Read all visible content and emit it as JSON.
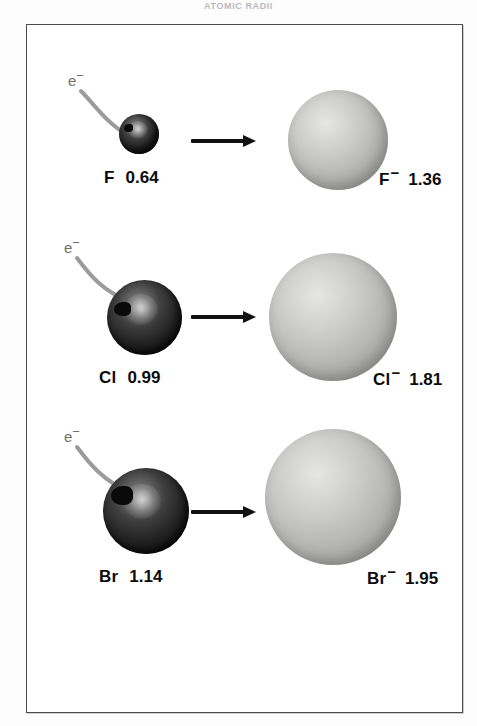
{
  "figure": {
    "top_caption": "ATOMIC RADII",
    "frame_color": "#4a4a50",
    "background_color": "#ffffff",
    "atom_color": "#1b1b1b",
    "ion_color": "#bdbdbb",
    "arrow_color": "#111111",
    "electron_curve_color": "#9b9b9b"
  },
  "rows": [
    {
      "id": "fluorine",
      "electron_label": "e",
      "electron_charge": "−",
      "atom": {
        "symbol": "F",
        "radius": "0.64",
        "radius_px": 20
      },
      "ion": {
        "symbol": "F",
        "charge": "−",
        "radius": "1.36",
        "radius_px": 50
      }
    },
    {
      "id": "chlorine",
      "electron_label": "e",
      "electron_charge": "−",
      "atom": {
        "symbol": "Cl",
        "radius": "0.99",
        "radius_px": 37
      },
      "ion": {
        "symbol": "Cl",
        "charge": "−",
        "radius": "1.81",
        "radius_px": 64
      }
    },
    {
      "id": "bromine",
      "electron_label": "e",
      "electron_charge": "−",
      "atom": {
        "symbol": "Br",
        "radius": "1.14",
        "radius_px": 43
      },
      "ion": {
        "symbol": "Br",
        "charge": "−",
        "radius": "1.95",
        "radius_px": 68
      }
    }
  ]
}
